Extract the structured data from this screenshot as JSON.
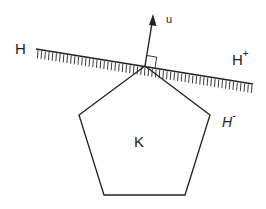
{
  "labels": {
    "hyperplane": "H",
    "positive_halfspace": "H",
    "positive_sup": "+",
    "negative_halfspace": "H",
    "negative_sup": "-",
    "normal_vector": "u",
    "convex_set": "K"
  },
  "colors": {
    "stroke": "#222222",
    "background": "#ffffff"
  }
}
